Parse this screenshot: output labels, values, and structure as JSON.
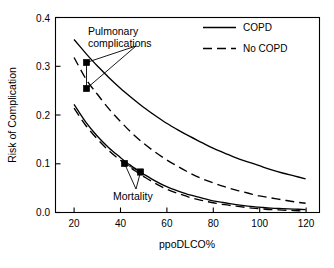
{
  "chart_data": {
    "type": "line",
    "title": "",
    "xlabel": "ppoDLCO%",
    "ylabel": "Risk of Complication",
    "xlim": [
      12,
      126
    ],
    "ylim": [
      0.0,
      0.4
    ],
    "grid": false,
    "legend_position": "top-right inside",
    "xticks": [
      "20",
      "40",
      "60",
      "80",
      "100",
      "120"
    ],
    "xtick_values": [
      20,
      40,
      60,
      80,
      100,
      120
    ],
    "yticks": [
      "0.0",
      "0.1",
      "0.2",
      "0.3",
      "0.4"
    ],
    "ytick_values": [
      0.0,
      0.1,
      0.2,
      0.3,
      0.4
    ],
    "legend": [
      {
        "name": "COPD",
        "style": "solid"
      },
      {
        "name": "No COPD",
        "style": "dashed"
      }
    ],
    "series": [
      {
        "name": "Pulmonary complications - COPD",
        "outcome": "Pulmonary complications",
        "group": "COPD",
        "style": "solid",
        "x": [
          20,
          25,
          28,
          30,
          35,
          40,
          45,
          50,
          55,
          60,
          65,
          70,
          75,
          80,
          85,
          90,
          95,
          100,
          105,
          110,
          115,
          120
        ],
        "y": [
          0.355,
          0.327,
          0.311,
          0.301,
          0.277,
          0.255,
          0.235,
          0.216,
          0.199,
          0.183,
          0.169,
          0.156,
          0.144,
          0.132,
          0.122,
          0.112,
          0.104,
          0.096,
          0.088,
          0.081,
          0.075,
          0.069
        ]
      },
      {
        "name": "Pulmonary complications - No COPD",
        "outcome": "Pulmonary complications",
        "group": "No COPD",
        "style": "dashed",
        "x": [
          20,
          25,
          28,
          30,
          35,
          40,
          45,
          50,
          55,
          60,
          65,
          70,
          75,
          80,
          85,
          90,
          95,
          100,
          105,
          110,
          115,
          120
        ],
        "y": [
          0.318,
          0.275,
          0.255,
          0.243,
          0.213,
          0.187,
          0.163,
          0.142,
          0.124,
          0.108,
          0.094,
          0.081,
          0.07,
          0.061,
          0.053,
          0.046,
          0.04,
          0.034,
          0.03,
          0.026,
          0.022,
          0.019
        ]
      },
      {
        "name": "Mortality - COPD",
        "outcome": "Mortality",
        "group": "COPD",
        "style": "solid",
        "x": [
          20,
          25,
          30,
          35,
          40,
          43,
          45,
          48,
          50,
          55,
          60,
          65,
          70,
          75,
          80,
          85,
          90,
          95,
          100,
          105,
          110,
          115,
          120
        ],
        "y": [
          0.222,
          0.186,
          0.157,
          0.133,
          0.113,
          0.101,
          0.095,
          0.085,
          0.079,
          0.065,
          0.053,
          0.044,
          0.036,
          0.03,
          0.024,
          0.02,
          0.016,
          0.013,
          0.011,
          0.009,
          0.008,
          0.007,
          0.006
        ]
      },
      {
        "name": "Mortality - No COPD",
        "outcome": "Mortality",
        "group": "No COPD",
        "style": "dashed",
        "x": [
          20,
          25,
          30,
          35,
          40,
          43,
          45,
          48,
          50,
          55,
          60,
          65,
          70,
          75,
          80,
          85,
          90,
          95,
          100,
          105,
          110,
          115,
          120
        ],
        "y": [
          0.214,
          0.179,
          0.151,
          0.127,
          0.107,
          0.096,
          0.09,
          0.08,
          0.074,
          0.06,
          0.048,
          0.039,
          0.031,
          0.025,
          0.02,
          0.016,
          0.013,
          0.01,
          0.008,
          0.006,
          0.005,
          0.004,
          0.003
        ]
      }
    ],
    "markers": [
      {
        "label": "Pulmonary complications",
        "group": "COPD",
        "x": 29,
        "y": 0.311
      },
      {
        "label": "Pulmonary complications",
        "group": "No COPD",
        "x": 29,
        "y": 0.255
      },
      {
        "label": "Mortality",
        "group": "COPD",
        "x": 43,
        "y": 0.101
      },
      {
        "label": "Mortality",
        "group": "No COPD",
        "x": 48,
        "y": 0.074
      }
    ],
    "annotations": [
      {
        "text": "Pulmonary",
        "name": "pulmonary-annotation-line1"
      },
      {
        "text": "complications",
        "name": "pulmonary-annotation-line2"
      },
      {
        "text": "Mortality",
        "name": "mortality-annotation"
      }
    ]
  }
}
